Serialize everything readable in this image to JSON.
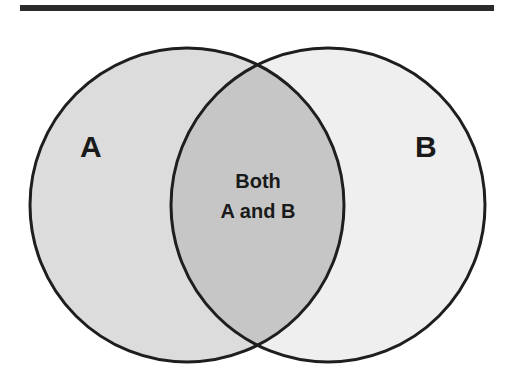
{
  "diagram": {
    "type": "venn",
    "sets": [
      {
        "id": "A",
        "label": "A",
        "fill": "#dcdcdc"
      },
      {
        "id": "B",
        "label": "B",
        "fill": "#efefef"
      }
    ],
    "intersection": {
      "line1": "Both",
      "line2": "A and B",
      "fill": "#c6c6c6"
    },
    "stroke": "#1e1e1e",
    "topbar_color": "#2a2a2a"
  }
}
